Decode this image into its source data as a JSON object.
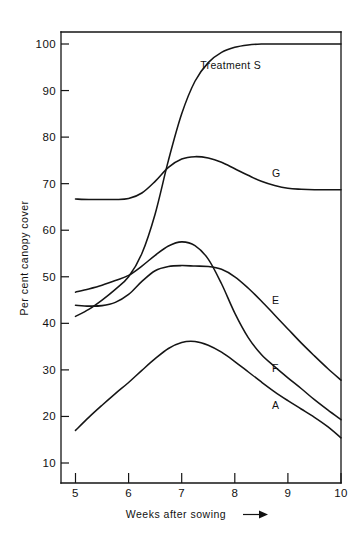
{
  "chart_data": {
    "type": "line",
    "title": "",
    "subtitle": "",
    "xlabel": "Weeks after sowing",
    "xlabel_suffix_icon": "right-arrow-icon",
    "ylabel": "Per cent canopy cover",
    "xlim": [
      4.7,
      10.0
    ],
    "ylim": [
      5.7,
      101.5
    ],
    "grid": false,
    "legend": "inline-curve-labels",
    "legend_position": "inline right of each curve",
    "x_ticks": [
      5,
      6,
      7,
      8,
      9,
      10
    ],
    "x_tick_labels": [
      "5",
      "6",
      "7",
      "8",
      "9",
      "10"
    ],
    "y_ticks": [
      10,
      20,
      30,
      40,
      50,
      60,
      70,
      80,
      90,
      100
    ],
    "y_tick_labels": [
      "10",
      "20",
      "30",
      "40",
      "50",
      "60",
      "70",
      "80",
      "90",
      "100"
    ],
    "x": [
      5.0,
      5.25,
      5.5,
      5.75,
      6.0,
      6.25,
      6.5,
      6.75,
      7.0,
      7.25,
      7.5,
      7.75,
      8.0,
      8.25,
      8.5,
      8.75,
      9.0,
      9.25,
      9.5,
      9.75,
      10.0
    ],
    "series": [
      {
        "name": "Treatment S",
        "label": "Treatment S",
        "label_x": 7.35,
        "label_y": 95.5,
        "values": [
          41.5,
          43.0,
          45.0,
          47.3,
          50.0,
          55.0,
          63.5,
          75.0,
          85.0,
          92.0,
          96.0,
          98.2,
          99.3,
          99.8,
          100.0,
          100.0,
          100.0,
          100.0,
          100.0,
          100.0,
          100.0
        ]
      },
      {
        "name": "G",
        "label": "G",
        "label_x": 8.7,
        "label_y": 72.3,
        "values": [
          66.7,
          66.6,
          66.6,
          66.6,
          66.8,
          68.0,
          70.5,
          73.5,
          75.3,
          75.8,
          75.5,
          74.6,
          73.2,
          71.8,
          70.5,
          69.6,
          69.0,
          68.8,
          68.7,
          68.7,
          68.7
        ]
      },
      {
        "name": "F",
        "label": "F",
        "label_x": 8.7,
        "label_y": 30.5,
        "values": [
          46.7,
          47.4,
          48.2,
          49.2,
          50.3,
          52.3,
          54.6,
          56.6,
          57.5,
          56.7,
          53.8,
          48.5,
          42.2,
          37.0,
          33.3,
          30.7,
          28.3,
          26.0,
          23.6,
          21.4,
          19.3
        ]
      },
      {
        "name": "E",
        "label": "E",
        "label_x": 8.7,
        "label_y": 45.0,
        "values": [
          43.9,
          43.7,
          43.8,
          44.5,
          46.2,
          49.0,
          51.3,
          52.2,
          52.4,
          52.3,
          52.2,
          51.6,
          50.0,
          47.6,
          44.8,
          41.8,
          38.8,
          35.8,
          33.0,
          30.3,
          27.8
        ]
      },
      {
        "name": "A",
        "label": "A",
        "label_x": 8.7,
        "label_y": 22.4,
        "values": [
          17.0,
          19.8,
          22.4,
          24.9,
          27.3,
          29.9,
          32.4,
          34.6,
          35.9,
          36.1,
          35.3,
          33.8,
          31.8,
          29.6,
          27.4,
          25.3,
          23.4,
          21.6,
          19.8,
          17.8,
          15.4
        ]
      }
    ]
  },
  "axes": {
    "y_axis_title": "Per cent canopy cover",
    "x_axis_title": "Weeks after sowing"
  }
}
